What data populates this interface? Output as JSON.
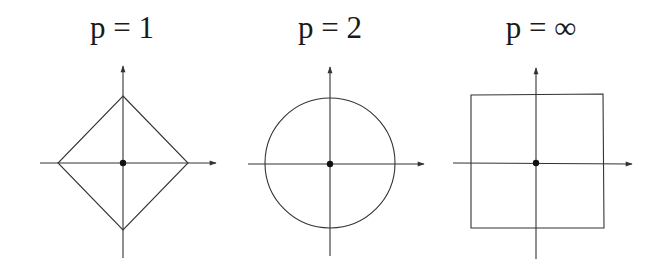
{
  "figure": {
    "panels": [
      {
        "title": "p = 1",
        "shape": "diamond",
        "norm": "L1"
      },
      {
        "title": "p = 2",
        "shape": "circle",
        "norm": "L2"
      },
      {
        "title": "p = ∞",
        "shape": "square",
        "norm": "L-infinity"
      }
    ],
    "colors": {
      "stroke": "#333333",
      "text": "#1a1a1a",
      "background": "#ffffff"
    }
  }
}
